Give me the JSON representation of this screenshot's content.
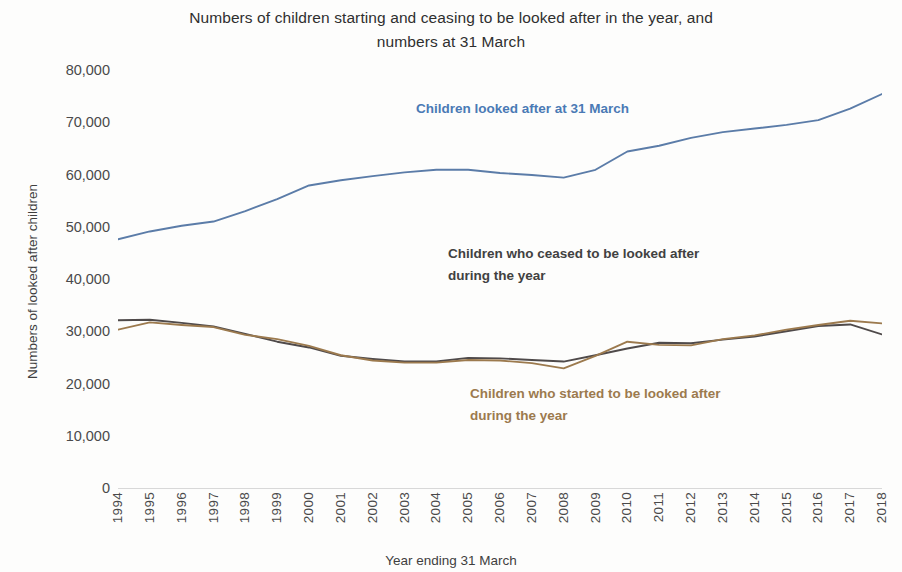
{
  "chart": {
    "title_line1": "Numbers of children starting and ceasing to be looked after in the year, and",
    "title_line2": "numbers at 31 March",
    "xlabel": "Year ending 31 March",
    "ylabel": "Numbers of looked after children"
  },
  "annotations": {
    "looked_after": "Children looked after at 31 March",
    "ceased": "Children who ceased to be looked after\nduring the year",
    "started": "Children who started to be looked after\nduring the year"
  },
  "colors": {
    "looked_after": "#5b7ca8",
    "ceased": "#4f4a4a",
    "started": "#9c7a4e",
    "axis_text": "#4a4a4a"
  },
  "chart_data": {
    "type": "line",
    "title": "Numbers of children starting and ceasing to be looked after in the year, and numbers at 31 March",
    "xlabel": "Year ending 31 March",
    "ylabel": "Numbers of looked after children",
    "ylim": [
      0,
      80000
    ],
    "ytick_labels": [
      "80,000",
      "70,000",
      "60,000",
      "50,000",
      "40,000",
      "30,000",
      "20,000",
      "10,000",
      "0"
    ],
    "yticks": [
      80000,
      70000,
      60000,
      50000,
      40000,
      30000,
      20000,
      10000,
      0
    ],
    "grid": false,
    "legend_position": "inline-annotations",
    "categories": [
      1994,
      1995,
      1996,
      1997,
      1998,
      1999,
      2000,
      2001,
      2002,
      2003,
      2004,
      2005,
      2006,
      2007,
      2008,
      2009,
      2010,
      2011,
      2012,
      2013,
      2014,
      2015,
      2016,
      2017,
      2018
    ],
    "series": [
      {
        "name": "Children looked after at 31 March",
        "color": "#5b7ca8",
        "values": [
          47600,
          49100,
          50200,
          51000,
          53000,
          55300,
          57900,
          58900,
          59700,
          60400,
          60900,
          60900,
          60300,
          59900,
          59400,
          60900,
          64400,
          65500,
          67000,
          68100,
          68800,
          69500,
          70400,
          72600,
          75400
        ]
      },
      {
        "name": "Children who ceased to be looked after during the year",
        "color": "#4f4a4a",
        "values": [
          32100,
          32200,
          31600,
          30900,
          29500,
          28000,
          26900,
          25300,
          24700,
          24200,
          24200,
          24900,
          24800,
          24500,
          24200,
          25400,
          26700,
          27800,
          27700,
          28400,
          29000,
          30000,
          31000,
          31300,
          29400
        ]
      },
      {
        "name": "Children who started to be looked after during the year",
        "color": "#9c7a4e",
        "values": [
          30300,
          31700,
          31200,
          30800,
          29300,
          28500,
          27200,
          25400,
          24400,
          24000,
          24000,
          24500,
          24400,
          23900,
          22900,
          25300,
          28000,
          27400,
          27300,
          28500,
          29200,
          30300,
          31200,
          32000,
          31500
        ]
      }
    ]
  }
}
